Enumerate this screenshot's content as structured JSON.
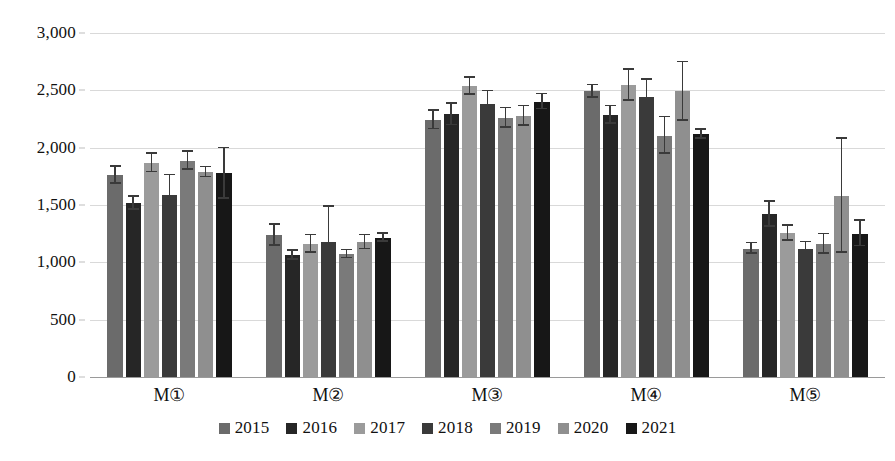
{
  "chart_data": {
    "type": "bar",
    "title": "",
    "subtitle": "",
    "xlabel": "",
    "ylabel": "",
    "ylim": [
      0,
      3000
    ],
    "ytick_values": [
      0,
      500,
      1000,
      1500,
      2000,
      2500,
      3000
    ],
    "ytick_labels": [
      "0",
      "500",
      "1,000",
      "1,500",
      "2,000",
      "2,500",
      "3,000"
    ],
    "categories": [
      "M①",
      "M②",
      "M③",
      "M④",
      "M⑤"
    ],
    "grid": "horizontal",
    "legend_position": "bottom-center",
    "error_bars": true,
    "series": [
      {
        "name": "2015",
        "color": "#6b6b6b",
        "values": [
          1760,
          1235,
          2240,
          2490,
          1120
        ],
        "errors": [
          75,
          90,
          80,
          55,
          45
        ]
      },
      {
        "name": "2016",
        "color": "#262626",
        "values": [
          1515,
          1060,
          2290,
          2285,
          1420
        ],
        "errors": [
          55,
          40,
          95,
          75,
          110
        ]
      },
      {
        "name": "2017",
        "color": "#9b9b9b",
        "values": [
          1865,
          1160,
          2535,
          2545,
          1255
        ],
        "errors": [
          80,
          75,
          75,
          135,
          65
        ]
      },
      {
        "name": "2018",
        "color": "#3a3a3a",
        "values": [
          1590,
          1180,
          2385,
          2440,
          1115
        ],
        "errors": [
          170,
          305,
          105,
          150,
          60
        ]
      },
      {
        "name": "2019",
        "color": "#7a7a7a",
        "values": [
          1885,
          1070,
          2260,
          2105,
          1160
        ],
        "errors": [
          80,
          35,
          85,
          160,
          85
        ]
      },
      {
        "name": "2020",
        "color": "#8f8f8f",
        "values": [
          1785,
          1175,
          2275,
          2490,
          1580
        ],
        "errors": [
          45,
          60,
          85,
          255,
          495
        ]
      },
      {
        "name": "2021",
        "color": "#171717",
        "values": [
          1775,
          1215,
          2400,
          2115,
          1250
        ],
        "errors": [
          220,
          35,
          65,
          40,
          110
        ]
      }
    ]
  },
  "legend": {
    "items": [
      {
        "label": "2015"
      },
      {
        "label": "2016"
      },
      {
        "label": "2017"
      },
      {
        "label": "2018"
      },
      {
        "label": "2019"
      },
      {
        "label": "2020"
      },
      {
        "label": "2021"
      }
    ]
  }
}
